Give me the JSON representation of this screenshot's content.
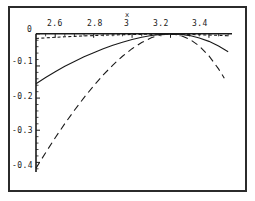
{
  "chart_data": {
    "type": "line",
    "title": "",
    "subtitle": "",
    "xlabel": "x",
    "ylabel": "",
    "xlim": [
      2.5,
      3.52
    ],
    "ylim": [
      -0.43,
      0.015
    ],
    "grid": false,
    "legend": null,
    "axis_position": {
      "x_axis_at_y": 0,
      "y_axis_at_x": 2.5
    },
    "xticks": [
      2.6,
      2.8,
      3.0,
      3.2,
      3.4
    ],
    "xtick_labels": [
      "2.6",
      "2.8",
      "3",
      "3.2",
      "3.4"
    ],
    "xminor_ticks": [
      2.55,
      2.65,
      2.7,
      2.75,
      2.85,
      2.9,
      2.95,
      3.05,
      3.1,
      3.15,
      3.25,
      3.3,
      3.35,
      3.45,
      3.5
    ],
    "yticks": [
      0,
      -0.1,
      -0.2,
      -0.3,
      -0.4
    ],
    "ytick_labels": [
      "0",
      "-0.1",
      "-0.2",
      "-0.3",
      "-0.4"
    ],
    "yminor_ticks": [
      -0.02,
      -0.04,
      -0.06,
      -0.08,
      -0.12,
      -0.14,
      -0.16,
      -0.18,
      -0.22,
      -0.24,
      -0.26,
      -0.28,
      -0.32,
      -0.34,
      -0.36,
      -0.38,
      -0.42
    ],
    "series": [
      {
        "name": "curve-short-dashed",
        "style": "short-dashed",
        "color": "#1a1a1a",
        "x": [
          2.5,
          2.55,
          2.6,
          2.65,
          2.7,
          2.75,
          2.8,
          2.85,
          2.9,
          2.95,
          3.0,
          3.05,
          3.1,
          3.15,
          3.2,
          3.25,
          3.3,
          3.35,
          3.4,
          3.45,
          3.5
        ],
        "y": [
          -0.0145,
          -0.0126,
          -0.0109,
          -0.0093,
          -0.0079,
          -0.0066,
          -0.0054,
          -0.0044,
          -0.0035,
          -0.0027,
          -0.0021,
          -0.0016,
          -0.0013,
          -0.0012,
          -0.0013,
          -0.0016,
          -0.0021,
          -0.0028,
          -0.0037,
          -0.0048,
          -0.0061
        ]
      },
      {
        "name": "curve-solid",
        "style": "solid",
        "color": "#1a1a1a",
        "x": [
          2.5,
          2.55,
          2.6,
          2.65,
          2.7,
          2.75,
          2.8,
          2.85,
          2.9,
          2.95,
          3.0,
          3.05,
          3.1,
          3.15,
          3.2,
          3.25,
          3.3,
          3.35,
          3.4,
          3.45,
          3.5
        ],
        "y": [
          -0.1555,
          -0.136,
          -0.118,
          -0.1012,
          -0.0858,
          -0.0716,
          -0.0586,
          -0.0466,
          -0.0358,
          -0.0262,
          -0.0178,
          -0.0108,
          -0.0052,
          -0.0016,
          -0.0002,
          -0.0014,
          -0.0055,
          -0.0128,
          -0.0235,
          -0.0378,
          -0.0558
        ]
      },
      {
        "name": "curve-long-dashed",
        "style": "long-dashed",
        "color": "#1a1a1a",
        "x": [
          2.5,
          2.55,
          2.6,
          2.65,
          2.7,
          2.75,
          2.8,
          2.85,
          2.9,
          2.95,
          3.0,
          3.05,
          3.1,
          3.15,
          3.2,
          3.25,
          3.3,
          3.35,
          3.4,
          3.45,
          3.48
        ],
        "y": [
          -0.418,
          -0.37,
          -0.3235,
          -0.2795,
          -0.2378,
          -0.1985,
          -0.1618,
          -0.128,
          -0.0972,
          -0.0698,
          -0.0462,
          -0.0268,
          -0.0122,
          -0.003,
          -0.0002,
          -0.0045,
          -0.0168,
          -0.0378,
          -0.0685,
          -0.1092,
          -0.138
        ]
      }
    ]
  },
  "axis": {
    "x_title": "x"
  }
}
